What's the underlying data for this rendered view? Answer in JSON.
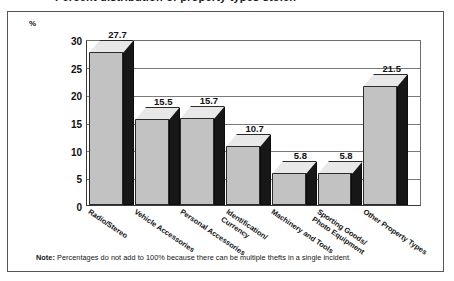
{
  "title": "Percent distribution of property types stolen",
  "chart_data": {
    "type": "bar",
    "title": "Percent distribution of property types stolen",
    "xlabel": "",
    "ylabel": "%",
    "ylim": [
      0,
      30
    ],
    "yticks": [
      0,
      5,
      10,
      15,
      20,
      25,
      30
    ],
    "grid": true,
    "legend": "none",
    "categories": [
      "Radio/Stereo",
      "Vehicle Accessories",
      "Personal Accessories",
      "Identification/\nCurrency",
      "Machinery and Tools",
      "Sporting Goods/\nPhoto Equipment",
      "Other Property Types"
    ],
    "values": [
      27.7,
      15.5,
      15.7,
      10.7,
      5.8,
      5.8,
      21.5
    ],
    "value_labels": [
      "27.7",
      "15.5",
      "15.7",
      "10.7",
      "5.8",
      "5.8",
      "21.5"
    ],
    "colors": {
      "bar_front": "#c2c2c2",
      "bar_side": "#171717",
      "bar_top": "#e8e8e8",
      "outline": "#2b2b2b",
      "gridline": "#7a7a7a",
      "axis": "#3a3a3a",
      "frame": "#575757",
      "text": "#111111",
      "background": "#ffffff"
    }
  },
  "axis": {
    "unit_label": "%",
    "tick_labels": [
      "30",
      "25",
      "20",
      "15",
      "10",
      "5",
      "0"
    ]
  },
  "category_labels": [
    {
      "line1": "Radio/Stereo",
      "line2": ""
    },
    {
      "line1": "Vehicle Accessories",
      "line2": ""
    },
    {
      "line1": "Personal Accessories",
      "line2": ""
    },
    {
      "line1": "Identification/",
      "line2": "Currency"
    },
    {
      "line1": "Machinery and Tools",
      "line2": ""
    },
    {
      "line1": "Sporting Goods/",
      "line2": "Photo Equipment"
    },
    {
      "line1": "Other Property Types",
      "line2": ""
    }
  ],
  "footnote": {
    "prefix": "Note:",
    "text": "Percentages do not add to 100% because there can be multiple thefts in a single incident."
  }
}
